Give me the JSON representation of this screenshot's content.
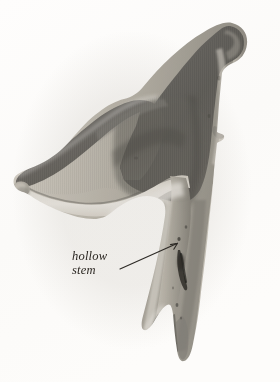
{
  "figure": {
    "background_color": "#fdfcfb",
    "image_width": 280,
    "image_height": 382,
    "rendering": "grayscale-halftone-photograph"
  },
  "annotations": [
    {
      "name": "hollow-stem-callout",
      "line_1": "hollow",
      "line_2": "stem",
      "text_color": "#2b2722",
      "leader_line": {
        "from_x": 120,
        "from_y": 269,
        "to_x": 178,
        "to_y": 243,
        "color": "#2d2a26",
        "arrowhead": true
      }
    }
  ],
  "palette": {
    "paper": "#fdfcfb",
    "cap_dark": "#5f5d5a",
    "cap_mid": "#7a7874",
    "cap_light": "#949189",
    "flesh_light": "#e8e4dc",
    "flesh_mid": "#c9c4ba",
    "stem_mid": "#b6b2a8",
    "stem_shadow": "#8d8a82",
    "cavity_dark": "#3a3833",
    "ink": "#2b2722"
  }
}
